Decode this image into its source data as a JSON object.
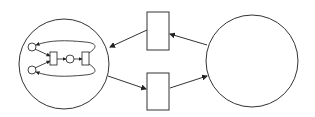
{
  "diagram": {
    "type": "petri-net-hierarchy",
    "stroke_color": "#333333",
    "background": "#ffffff",
    "nodes": [
      {
        "id": "left-place",
        "kind": "place",
        "label": ""
      },
      {
        "id": "right-place",
        "kind": "place",
        "label": ""
      },
      {
        "id": "top-transition",
        "kind": "transition",
        "label": ""
      },
      {
        "id": "bottom-transition",
        "kind": "transition",
        "label": ""
      }
    ],
    "subnet": {
      "places": 3,
      "transitions": 2
    },
    "edges": [
      {
        "from": "right-place",
        "to": "top-transition"
      },
      {
        "from": "top-transition",
        "to": "left-place"
      },
      {
        "from": "left-place",
        "to": "bottom-transition"
      },
      {
        "from": "bottom-transition",
        "to": "right-place"
      }
    ]
  }
}
